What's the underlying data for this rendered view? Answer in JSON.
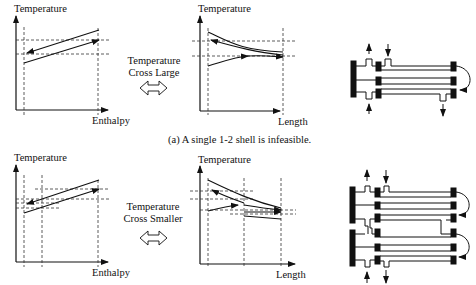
{
  "figure": {
    "row_a": {
      "left_plot": {
        "ylabel": "Temperature",
        "xlabel": "Enthalpy"
      },
      "annotation": {
        "line1": "Temperature",
        "line2": "Cross Large"
      },
      "right_plot": {
        "ylabel": "Temperature",
        "xlabel": "Length"
      },
      "caption": "(a)  A single 1-2 shell is infeasible.",
      "exchanger": {
        "shells": 1,
        "description": "single 1-2 shell-and-tube exchanger"
      }
    },
    "row_b": {
      "left_plot": {
        "ylabel": "Temperature",
        "xlabel": "Enthalpy"
      },
      "annotation": {
        "line1": "Temperature",
        "line2": "Cross Smaller"
      },
      "right_plot": {
        "ylabel": "Temperature",
        "xlabel": "Length"
      },
      "exchanger": {
        "shells": 2,
        "description": "two 1-2 shells in series"
      }
    },
    "icons": {
      "double_arrow": "double-headed-arrow-icon"
    }
  }
}
